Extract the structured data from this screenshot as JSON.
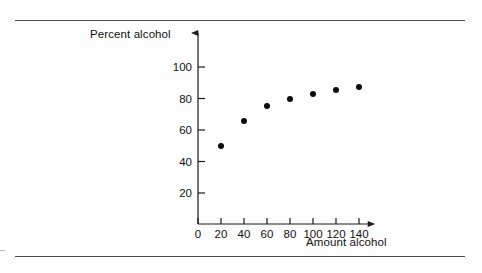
{
  "figure": {
    "background_color": "#fdfdfd",
    "rule_color": "#4a4a4a",
    "marker_color": "#0c0c0c",
    "axis_color": "#1a1a1a"
  },
  "chart_data": {
    "type": "scatter",
    "title": "",
    "subtitle": "",
    "xlabel": "Amount alcohol",
    "ylabel": "Percent alcohol",
    "x": [
      20,
      40,
      60,
      80,
      100,
      120,
      140
    ],
    "values": [
      50,
      66,
      75,
      80,
      83,
      85.5,
      87.5
    ],
    "series": [
      {
        "name": "Percent alcohol",
        "x": [
          20,
          40,
          60,
          80,
          100,
          120,
          140
        ],
        "values": [
          50,
          66,
          75,
          80,
          83,
          85.5,
          87.5
        ]
      }
    ],
    "xlim": [
      0,
      150
    ],
    "ylim": [
      0,
      108
    ],
    "xticks": [
      0,
      20,
      40,
      60,
      80,
      100,
      120,
      140
    ],
    "xtick_labels": [
      "0",
      "20",
      "40",
      "60",
      "80",
      "100",
      "120",
      "140"
    ],
    "yticks": [
      20,
      40,
      60,
      80,
      100
    ],
    "ytick_labels": [
      "20",
      "40",
      "60",
      "80",
      "100"
    ],
    "grid": false,
    "legend": false,
    "legend_position": "none",
    "annotations": [],
    "axis_arrows": {
      "x_axis_arrow": true,
      "y_axis_arrow": true
    }
  }
}
